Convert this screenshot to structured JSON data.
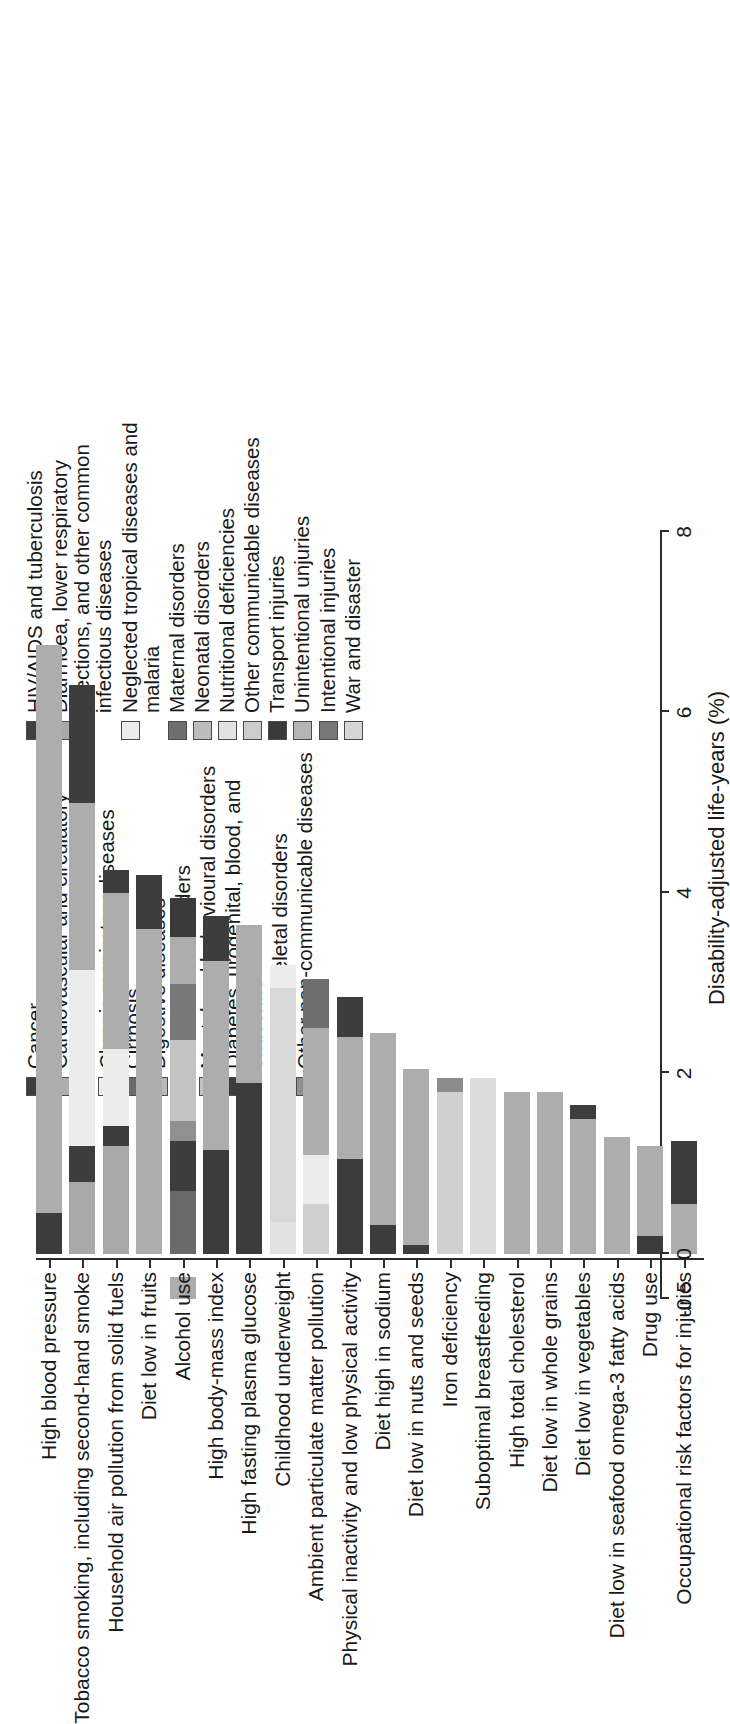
{
  "chart_data": {
    "type": "bar",
    "subtype": "stacked-horizontal-bar",
    "title": "",
    "xlabel": "Disability-adjusted life-years (%)",
    "ylabel": "",
    "xlim": [
      -0.5,
      8
    ],
    "xticks": [
      -0.5,
      0,
      2,
      4,
      6,
      8
    ],
    "xticklabels": [
      "-0.5",
      "0",
      "2",
      "4",
      "6",
      "8"
    ],
    "grid": false,
    "legend_position": "top-right (two columns)",
    "categories": [
      "High blood pressure",
      "Tobacco smoking, including second-hand smoke",
      "Household air pollution from solid fuels",
      "Diet low in fruits",
      "Alcohol use",
      "High body-mass index",
      "High fasting plasma glucose",
      "Childhood underweight",
      "Ambient particulate matter pollution",
      "Physical inactivity and low physical activity",
      "Diet high in sodium",
      "Diet low in nuts and seeds",
      "Iron deficiency",
      "Suboptimal breastfeeding",
      "High total cholesterol",
      "Diet low in whole grains",
      "Diet low in vegetables",
      "Diet low in seafood omega-3 fatty acids",
      "Drug use",
      "Occupational risk factors for injuries"
    ],
    "totals": [
      6.75,
      6.3,
      4.45,
      4.2,
      3.95,
      3.75,
      3.65,
      3.2,
      3.05,
      2.85,
      2.45,
      2.05,
      1.95,
      1.95,
      1.8,
      1.8,
      1.65,
      1.3,
      1.2,
      1.25
    ],
    "series": [
      {
        "name": "HIV/AIDS and tuberculosis",
        "color": "#3f3f3f"
      },
      {
        "name": "Diarrhoea, lower respiratory infections, and other common infectious diseases",
        "color": "#a8a8a8"
      },
      {
        "name": "Neglected tropical diseases and malaria",
        "color": "#ececec"
      },
      {
        "name": "Maternal disorders",
        "color": "#6e6e6e"
      },
      {
        "name": "Neonatal disorders",
        "color": "#bcbcbc"
      },
      {
        "name": "Nutritional deficiencies",
        "color": "#e2e2e2"
      },
      {
        "name": "Other communicable diseases",
        "color": "#cccccc"
      },
      {
        "name": "Transport injuries",
        "color": "#3a3a3a"
      },
      {
        "name": "Unintentional unjuries",
        "color": "#b4b4b4"
      },
      {
        "name": "Intentional injuries",
        "color": "#787878"
      },
      {
        "name": "War and disaster",
        "color": "#d6d6d6"
      },
      {
        "name": "Cancer",
        "color": "#3d3d3d"
      },
      {
        "name": "Cardiovascular and circulatory diseases",
        "color": "#adadad"
      },
      {
        "name": "Chronic respiratory diseases",
        "color": "#ececec"
      },
      {
        "name": "Cirrhosis",
        "color": "#6a6a6a"
      },
      {
        "name": "Digestive diseases",
        "color": "#b9b9b9"
      },
      {
        "name": "Neurological disorders",
        "color": "#e6e6e6"
      },
      {
        "name": "Mental and behavioural disorders",
        "color": "#c3c3c3"
      },
      {
        "name": "Diabetes, urogenital, blood, and endocrine",
        "color": "#3c3c3c"
      },
      {
        "name": "Musculoskeletal disorders",
        "color": "#dcdcdc"
      },
      {
        "name": "Other non-communicable diseases",
        "color": "#909090"
      }
    ],
    "bars": [
      {
        "category": "High blood pressure",
        "total": 6.75,
        "segments": [
          {
            "name": "Cancer",
            "value": 0.0,
            "start": 0.0
          },
          {
            "name": "Diabetes, urogenital, blood, and endocrine",
            "value": 0.45,
            "start": 0.0,
            "color": "#3c3c3c"
          },
          {
            "name": "Cardiovascular and circulatory diseases",
            "value": 6.3,
            "start": 0.45,
            "color": "#adadad"
          }
        ]
      },
      {
        "category": "Tobacco smoking, including second-hand smoke",
        "total": 6.3,
        "segments": [
          {
            "name": "Diarrhoea, lower respiratory infections, and other common infectious diseases",
            "value": 0.8,
            "start": 0.0,
            "color": "#a8a8a8"
          },
          {
            "name": "Cancer",
            "value": 0.4,
            "start": 0.8,
            "color": "#3d3d3d"
          },
          {
            "name": "Chronic respiratory diseases",
            "value": 1.95,
            "start": 1.2,
            "color": "#ececec"
          },
          {
            "name": "Cardiovascular and circulatory diseases",
            "value": 1.85,
            "start": 3.15,
            "color": "#adadad"
          },
          {
            "name": "Cancer",
            "value": 1.3,
            "start": 5.0,
            "color": "#3d3d3d"
          }
        ]
      },
      {
        "category": "Household air pollution from solid fuels",
        "total": 4.45,
        "segments": [
          {
            "name": "Diarrhoea, lower respiratory infections, and other common infectious diseases",
            "value": 1.2,
            "start": 0.0,
            "color": "#a8a8a8"
          },
          {
            "name": "Cancer",
            "value": 0.22,
            "start": 1.2,
            "color": "#3d3d3d"
          },
          {
            "name": "Chronic respiratory diseases",
            "value": 0.85,
            "start": 1.42,
            "color": "#ececec"
          },
          {
            "name": "Cardiovascular and circulatory diseases",
            "value": 1.73,
            "start": 2.27,
            "color": "#adadad"
          },
          {
            "name": "Cancer",
            "value": 0.25,
            "start": 4.0,
            "color": "#3d3d3d"
          }
        ]
      },
      {
        "category": "Diet low in fruits",
        "total": 4.2,
        "segments": [
          {
            "name": "Cardiovascular and circulatory diseases",
            "value": 3.6,
            "start": 0.0,
            "color": "#adadad"
          },
          {
            "name": "Cancer",
            "value": 0.6,
            "start": 3.6,
            "color": "#3d3d3d"
          }
        ]
      },
      {
        "category": "Alcohol use",
        "total": 3.95,
        "segments": [
          {
            "name": "Cardiovascular and circulatory diseases",
            "value": -0.25,
            "start": -0.25,
            "color": "#adadad"
          },
          {
            "name": "Cirrhosis",
            "value": 0.7,
            "start": 0.0,
            "color": "#6a6a6a"
          },
          {
            "name": "Cancer",
            "value": 0.55,
            "start": 0.7,
            "color": "#3d3d3d"
          },
          {
            "name": "Other non-communicable diseases",
            "value": 0.22,
            "start": 1.25,
            "color": "#909090"
          },
          {
            "name": "Mental and behavioural disorders",
            "value": 0.9,
            "start": 1.47,
            "color": "#c3c3c3"
          },
          {
            "name": "Unintentional unjuries",
            "value": 0.62,
            "start": 2.37,
            "color": "#787878"
          },
          {
            "name": "Cardiovascular and circulatory diseases",
            "value": 0.52,
            "start": 2.99,
            "color": "#adadad"
          },
          {
            "name": "Transport injuries",
            "value": 0.44,
            "start": 3.51,
            "color": "#3a3a3a"
          }
        ]
      },
      {
        "category": "High body-mass index",
        "total": 3.75,
        "segments": [
          {
            "name": "Diabetes, urogenital, blood, and endocrine",
            "value": 1.15,
            "start": 0.0,
            "color": "#3c3c3c"
          },
          {
            "name": "Cardiovascular and circulatory diseases",
            "value": 2.1,
            "start": 1.15,
            "color": "#adadad"
          },
          {
            "name": "Cancer",
            "value": 0.5,
            "start": 3.25,
            "color": "#3d3d3d"
          }
        ]
      },
      {
        "category": "High fasting plasma glucose",
        "total": 3.65,
        "segments": [
          {
            "name": "Diabetes, urogenital, blood, and endocrine",
            "value": 1.9,
            "start": 0.0,
            "color": "#3c3c3c"
          },
          {
            "name": "Cardiovascular and circulatory diseases",
            "value": 1.75,
            "start": 1.9,
            "color": "#adadad"
          }
        ]
      },
      {
        "category": "Childhood underweight",
        "total": 3.2,
        "segments": [
          {
            "name": "Nutritional deficiencies",
            "value": 0.35,
            "start": 0.0,
            "color": "#e2e2e2"
          },
          {
            "name": "Diarrhoea, lower respiratory infections, and other common infectious diseases",
            "value": 2.6,
            "start": 0.35,
            "color": "#d8d8d8"
          },
          {
            "name": "Neglected tropical diseases and malaria",
            "value": 0.25,
            "start": 2.95,
            "color": "#ececec"
          }
        ]
      },
      {
        "category": "Ambient particulate matter pollution",
        "total": 3.05,
        "segments": [
          {
            "name": "Diarrhoea, lower respiratory infections, and other common infectious diseases",
            "value": 0.55,
            "start": 0.0,
            "color": "#cfcfcf"
          },
          {
            "name": "Chronic respiratory diseases",
            "value": 0.55,
            "start": 0.55,
            "color": "#ececec"
          },
          {
            "name": "Cardiovascular and circulatory diseases",
            "value": 1.4,
            "start": 1.1,
            "color": "#adadad"
          },
          {
            "name": "Cancer",
            "value": 0.55,
            "start": 2.5,
            "color": "#6e6e6e"
          }
        ]
      },
      {
        "category": "Physical inactivity and low physical activity",
        "total": 2.85,
        "segments": [
          {
            "name": "Diabetes, urogenital, blood, and endocrine",
            "value": 1.05,
            "start": 0.0,
            "color": "#3c3c3c"
          },
          {
            "name": "Cardiovascular and circulatory diseases",
            "value": 1.35,
            "start": 1.05,
            "color": "#adadad"
          },
          {
            "name": "Cancer",
            "value": 0.45,
            "start": 2.4,
            "color": "#3d3d3d"
          }
        ]
      },
      {
        "category": "Diet high in sodium",
        "total": 2.45,
        "segments": [
          {
            "name": "Diabetes, urogenital, blood, and endocrine",
            "value": 0.32,
            "start": 0.0,
            "color": "#3c3c3c"
          },
          {
            "name": "Cardiovascular and circulatory diseases",
            "value": 2.13,
            "start": 0.32,
            "color": "#adadad"
          }
        ]
      },
      {
        "category": "Diet low in nuts and seeds",
        "total": 2.05,
        "segments": [
          {
            "name": "Diabetes, urogenital, blood, and endocrine",
            "value": 0.1,
            "start": 0.0,
            "color": "#3c3c3c"
          },
          {
            "name": "Cardiovascular and circulatory diseases",
            "value": 1.95,
            "start": 0.1,
            "color": "#adadad"
          }
        ]
      },
      {
        "category": "Iron deficiency",
        "total": 1.95,
        "segments": [
          {
            "name": "Nutritional deficiencies",
            "value": 1.8,
            "start": 0.0,
            "color": "#d0d0d0"
          },
          {
            "name": "Maternal disorders",
            "value": 0.15,
            "start": 1.8,
            "color": "#8b8b8b"
          }
        ]
      },
      {
        "category": "Suboptimal breastfeeding",
        "total": 1.95,
        "segments": [
          {
            "name": "Diarrhoea, lower respiratory infections, and other common infectious diseases",
            "value": 1.95,
            "start": 0.0,
            "color": "#dcdcdc"
          }
        ]
      },
      {
        "category": "High total cholesterol",
        "total": 1.8,
        "segments": [
          {
            "name": "Cardiovascular and circulatory diseases",
            "value": 1.8,
            "start": 0.0,
            "color": "#adadad"
          }
        ]
      },
      {
        "category": "Diet low in whole grains",
        "total": 1.8,
        "segments": [
          {
            "name": "Cardiovascular and circulatory diseases",
            "value": 1.8,
            "start": 0.0,
            "color": "#adadad"
          }
        ]
      },
      {
        "category": "Diet low in vegetables",
        "total": 1.65,
        "segments": [
          {
            "name": "Cardiovascular and circulatory diseases",
            "value": 1.5,
            "start": 0.0,
            "color": "#adadad"
          },
          {
            "name": "Cancer",
            "value": 0.15,
            "start": 1.5,
            "color": "#3d3d3d"
          }
        ]
      },
      {
        "category": "Diet low in seafood omega-3 fatty acids",
        "total": 1.3,
        "segments": [
          {
            "name": "Cardiovascular and circulatory diseases",
            "value": 1.3,
            "start": 0.0,
            "color": "#adadad"
          }
        ]
      },
      {
        "category": "Drug use",
        "total": 1.2,
        "segments": [
          {
            "name": "Mental and behavioural disorders",
            "value": 0.2,
            "start": 0.0,
            "color": "#3c3c3c"
          },
          {
            "name": "Other non-communicable diseases",
            "value": 1.0,
            "start": 0.2,
            "color": "#adadad"
          }
        ]
      },
      {
        "category": "Occupational risk factors for injuries",
        "total": 1.25,
        "segments": [
          {
            "name": "Unintentional unjuries",
            "value": 0.55,
            "start": 0.0,
            "color": "#adadad"
          },
          {
            "name": "Transport injuries",
            "value": 0.7,
            "start": 0.55,
            "color": "#3c3c3c"
          }
        ]
      }
    ]
  },
  "legend_ncd": {
    "items": [
      {
        "label": "Cancer",
        "color": "#3d3d3d"
      },
      {
        "label": "Cardiovascular and circulatory diseases",
        "color": "#adadad"
      },
      {
        "label": "Chronic respiratory diseases",
        "color": "#ececec"
      },
      {
        "label": "Cirrhosis",
        "color": "#6a6a6a"
      },
      {
        "label": "Digestive diseases",
        "color": "#b9b9b9"
      },
      {
        "label": "Neurological disorders",
        "color": "#e6e6e6"
      },
      {
        "label": "Mental and behavioural disorders",
        "color": "#c3c3c3"
      },
      {
        "label": "Diabetes, urogenital, blood, and endocrine",
        "color": "#3c3c3c"
      },
      {
        "label": "Musculoskeletal disorders",
        "color": "#dcdcdc"
      },
      {
        "label": "Other non-communicable diseases",
        "color": "#909090"
      }
    ]
  },
  "legend_cd": {
    "items": [
      {
        "label": "HIV/AIDS and tuberculosis",
        "color": "#3f3f3f"
      },
      {
        "label": "Diarrhoea, lower respiratory infections, and other common infectious diseases",
        "color": "#a8a8a8"
      },
      {
        "label": "Neglected tropical diseases and malaria",
        "color": "#ececec"
      },
      {
        "label": "Maternal disorders",
        "color": "#6e6e6e"
      },
      {
        "label": "Neonatal disorders",
        "color": "#bcbcbc"
      },
      {
        "label": "Nutritional deficiencies",
        "color": "#e2e2e2"
      },
      {
        "label": "Other communicable diseases",
        "color": "#cccccc"
      },
      {
        "label": "Transport injuries",
        "color": "#3a3a3a"
      },
      {
        "label": "Unintentional unjuries",
        "color": "#b4b4b4"
      },
      {
        "label": "Intentional injuries",
        "color": "#787878"
      },
      {
        "label": "War and disaster",
        "color": "#d6d6d6"
      }
    ]
  }
}
